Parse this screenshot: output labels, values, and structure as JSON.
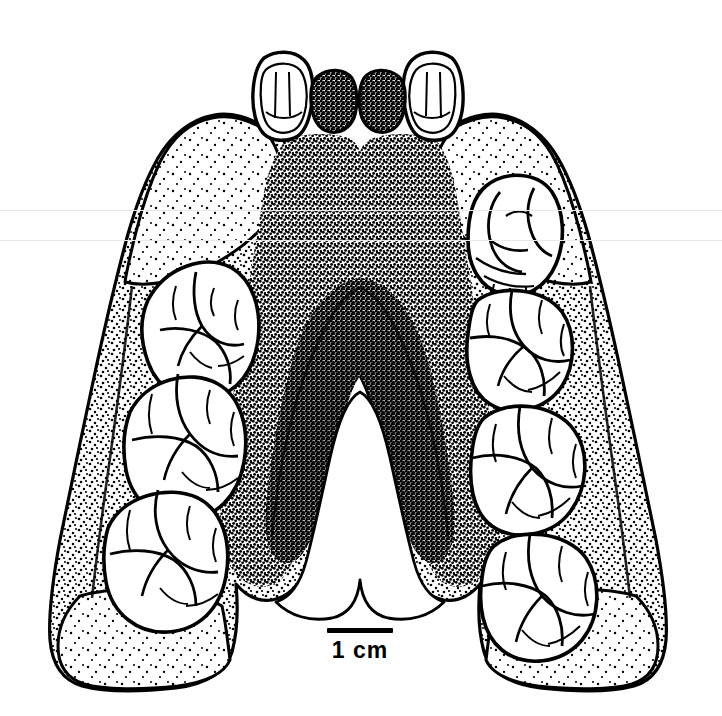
{
  "figure": {
    "kind": "scientific-line-drawing",
    "background_color": "#ffffff",
    "ink_color": "#000000",
    "artifact_color": "#e9e9e9"
  },
  "scale": {
    "label": "1 cm",
    "bar_length_px": 66,
    "bar_thickness_px": 5
  },
  "artifacts": {
    "scanline_upper_label": "",
    "scanline_lower_label": ""
  },
  "anatomy": {
    "palate_label": "",
    "left_arcade_label": "",
    "right_arcade_label": "",
    "incisor_label": ""
  },
  "teeth": {
    "left_row": [
      {
        "name": "left-lateral-incisor"
      },
      {
        "name": "left-central-incisor-root"
      },
      {
        "name": "left-first-molar"
      },
      {
        "name": "left-second-molar"
      },
      {
        "name": "left-third-molar"
      }
    ],
    "right_row": [
      {
        "name": "right-central-incisor-root"
      },
      {
        "name": "right-lateral-incisor"
      },
      {
        "name": "right-premolar"
      },
      {
        "name": "right-first-molar"
      },
      {
        "name": "right-second-molar"
      },
      {
        "name": "right-third-molar"
      }
    ]
  }
}
